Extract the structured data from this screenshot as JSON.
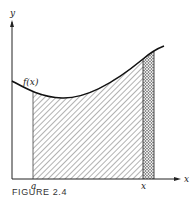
{
  "figure": {
    "caption": "FIGURE 2.4",
    "y_axis_label": "y",
    "x_axis_label": "x",
    "function_label": "f(x)",
    "lower_bound_label": "a",
    "upper_bound_label": "x",
    "colors": {
      "curve": "#111111",
      "axis": "#222222",
      "hatch": "#555555",
      "crosshatch": "#333333",
      "background": "#ffffff"
    },
    "regions": [
      {
        "name": "area-under-curve-from-a-to-x",
        "pattern": "diagonal-hatch"
      },
      {
        "name": "incremental-strip-at-x",
        "pattern": "cross-hatch"
      }
    ]
  }
}
